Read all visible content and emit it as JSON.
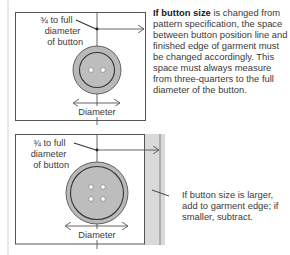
{
  "top_panel": {
    "label_lines": [
      "¾ to full",
      "diameter",
      "of button"
    ],
    "diameter_label": "Diameter",
    "button_holes": 2,
    "note_bold": "If button size",
    "note_rest": " is changed from pattern specification, the space between button position line and finished edge of garment must be changed accordingly. This space must always measure from three-quarters to the full diameter of the button."
  },
  "bottom_panel": {
    "label_lines": [
      "¾ to full",
      "diameter",
      "of button"
    ],
    "diameter_label": "Diameter",
    "button_holes": 4,
    "note": "If button size is larger, add to garment edge; if smaller, subtract."
  },
  "colors": {
    "line": "#555555",
    "button_fill": "#b9b9b9",
    "button_ring": "#333333",
    "garment_strip": "#d9d9d9",
    "margin_line": "#cfcfcf"
  }
}
